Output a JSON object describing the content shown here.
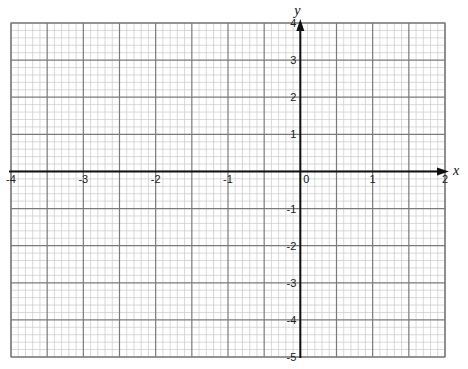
{
  "chart_data": {
    "type": "scatter",
    "title": "",
    "xlabel": "x",
    "ylabel": "y",
    "xlim": [
      -4,
      2
    ],
    "ylim": [
      -5,
      4
    ],
    "grid": true,
    "grid_major_x_step": 0.5,
    "grid_major_y_step": 1,
    "grid_minor_subdivisions": 5,
    "x_ticks": [
      -4,
      -3,
      -2,
      -1,
      0,
      1,
      2
    ],
    "y_ticks": [
      4,
      3,
      2,
      1,
      -1,
      -2,
      -3,
      -4,
      -5
    ],
    "x_tick_labels": [
      "-4",
      "-3",
      "-2",
      "-1",
      "0",
      "1",
      "2"
    ],
    "y_tick_labels": [
      "4",
      "3",
      "2",
      "1",
      "-1",
      "-2",
      "-3",
      "-4",
      "-5"
    ],
    "series": [],
    "legend": null
  },
  "colors": {
    "minor_grid": "#c8c8c8",
    "major_grid": "#7a7a7a",
    "axis": "#111111",
    "background": "#ffffff"
  },
  "axes": {
    "x_label": "x",
    "y_label": "y"
  }
}
